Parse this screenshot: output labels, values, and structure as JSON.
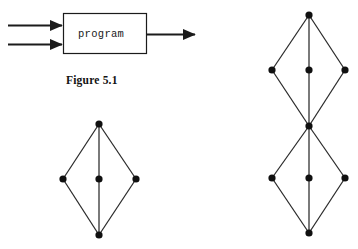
{
  "figure": {
    "caption": "Figure 5.1",
    "caption_x": 66,
    "caption_y": 74,
    "block_diagram": {
      "box_label": "program",
      "box": {
        "x": 63,
        "y": 13,
        "width": 83,
        "height": 40
      },
      "box_label_x": 78,
      "box_label_y": 28,
      "stroke": "#1b1b1b",
      "input_arrows": [
        {
          "name": "input-arrow-top",
          "x1": 8,
          "y1": 25,
          "x2": 62,
          "y2": 25
        },
        {
          "name": "input-arrow-bottom",
          "x1": 8,
          "y1": 44,
          "x2": 62,
          "y2": 44
        }
      ],
      "output_arrows": [
        {
          "name": "output-arrow",
          "x1": 146,
          "y1": 34,
          "x2": 195,
          "y2": 34
        }
      ]
    },
    "graphs": [
      {
        "name": "single-diamond-graph",
        "node_color": "#101010",
        "edge_color": "#2a2a2a",
        "node_radius": 3.6,
        "nodes": [
          {
            "id": "top",
            "x": 99,
            "y": 124
          },
          {
            "id": "left",
            "x": 63,
            "y": 179
          },
          {
            "id": "center",
            "x": 99,
            "y": 179
          },
          {
            "id": "right",
            "x": 136,
            "y": 179
          },
          {
            "id": "bottom",
            "x": 99,
            "y": 235
          }
        ],
        "edges": [
          [
            "top",
            "left"
          ],
          [
            "top",
            "center"
          ],
          [
            "top",
            "right"
          ],
          [
            "left",
            "bottom"
          ],
          [
            "center",
            "bottom"
          ],
          [
            "right",
            "bottom"
          ]
        ]
      },
      {
        "name": "double-diamond-graph",
        "node_color": "#101010",
        "edge_color": "#2a2a2a",
        "node_radius": 3.6,
        "nodes": [
          {
            "id": "top",
            "x": 309,
            "y": 15
          },
          {
            "id": "u-left",
            "x": 272,
            "y": 70
          },
          {
            "id": "u-center",
            "x": 309,
            "y": 70
          },
          {
            "id": "u-right",
            "x": 345,
            "y": 70
          },
          {
            "id": "waist",
            "x": 309,
            "y": 126
          },
          {
            "id": "l-left",
            "x": 272,
            "y": 178
          },
          {
            "id": "l-center",
            "x": 309,
            "y": 178
          },
          {
            "id": "l-right",
            "x": 345,
            "y": 178
          },
          {
            "id": "bottom",
            "x": 309,
            "y": 233
          }
        ],
        "edges": [
          [
            "top",
            "u-left"
          ],
          [
            "top",
            "u-center"
          ],
          [
            "top",
            "u-right"
          ],
          [
            "u-left",
            "waist"
          ],
          [
            "u-center",
            "waist"
          ],
          [
            "u-right",
            "waist"
          ],
          [
            "waist",
            "l-left"
          ],
          [
            "waist",
            "l-center"
          ],
          [
            "waist",
            "l-right"
          ],
          [
            "l-left",
            "bottom"
          ],
          [
            "l-center",
            "bottom"
          ],
          [
            "l-right",
            "bottom"
          ]
        ]
      }
    ]
  }
}
